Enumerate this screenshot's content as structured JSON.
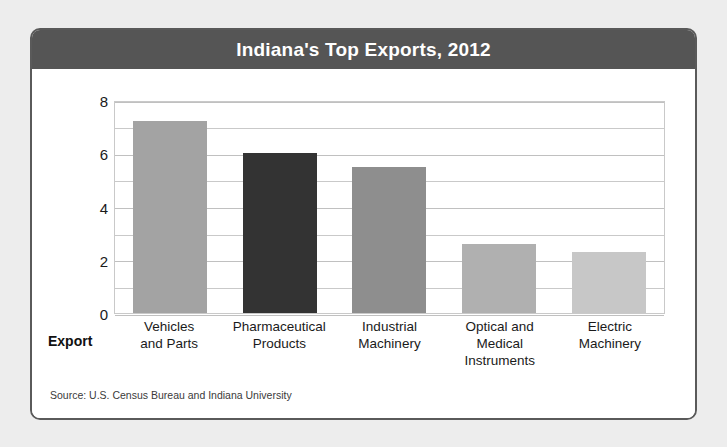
{
  "card": {
    "title": "Indiana's Top Exports, 2012",
    "source_note": "Source: U.S. Census Bureau and Indiana University",
    "header_color": "#555555",
    "border_color": "#5a5a5a"
  },
  "chart_data": {
    "type": "bar",
    "title": "Indiana's Top Exports, 2012",
    "categories": [
      "Vehicles and Parts",
      "Pharmaceutical Products",
      "Industrial Machinery",
      "Optical and Medical Instruments",
      "Electric Machinery"
    ],
    "category_lines": [
      [
        "Vehicles",
        "and Parts"
      ],
      [
        "Pharmaceutical",
        "Products"
      ],
      [
        "Industrial",
        "Machinery"
      ],
      [
        "Optical and Medical",
        "Instruments"
      ],
      [
        "Electric",
        "Machinery"
      ]
    ],
    "values": [
      7.2,
      6.0,
      5.5,
      2.6,
      2.3
    ],
    "bar_colors": [
      "#a3a3a3",
      "#333333",
      "#8e8e8e",
      "#b0b0b0",
      "#c7c7c7"
    ],
    "xlabel": "Export",
    "ylabel": "Millions of dollars",
    "ylim": [
      0,
      8
    ],
    "yticks": [
      0,
      2,
      4,
      6,
      8
    ],
    "ytick_labels": [
      "0",
      "2",
      "4",
      "6",
      "8"
    ],
    "minor_tick_step": 1,
    "grid": true,
    "legend": "none"
  }
}
